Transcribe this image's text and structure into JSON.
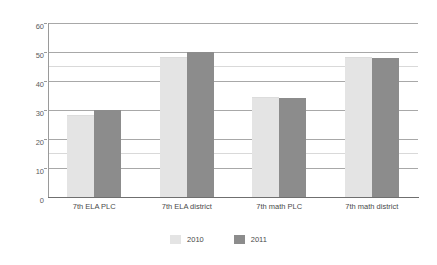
{
  "chart_data": {
    "type": "bar",
    "title": "",
    "subtitle": "",
    "xlabel": "",
    "ylabel": "",
    "categories": [
      "7th ELA PLC",
      "7th ELA district",
      "7th math PLC",
      "7th math district"
    ],
    "series": [
      {
        "name": "2010",
        "color": "#e4e4e4",
        "values": [
          28,
          48,
          34,
          48
        ]
      },
      {
        "name": "2011",
        "color": "#8c8c8c",
        "values": [
          30,
          50,
          34,
          48
        ]
      }
    ],
    "ylim": [
      0,
      60
    ],
    "yticks": [
      0,
      10,
      20,
      30,
      40,
      50,
      60
    ],
    "ytick_labels": [
      "0",
      "10",
      "20",
      "30",
      "40",
      "50",
      "60"
    ],
    "grid": true,
    "grid_axis": "y",
    "legend_position": "bottom",
    "annotations": []
  },
  "legend": {
    "entries": [
      {
        "label": "2010",
        "swatch": "legend-swatch-2010"
      },
      {
        "label": "2011",
        "swatch": "legend-swatch-2011"
      }
    ]
  },
  "axis": {
    "y_tick_labels": [
      "60",
      "50",
      "40",
      "30",
      "20",
      "10",
      "0"
    ]
  },
  "colors": {
    "series_2010": "#e4e4e4",
    "series_2011": "#8c8c8c",
    "gridline": "#a8a8a8",
    "axis": "#6f6f6f",
    "text": "#4a4a4a"
  }
}
